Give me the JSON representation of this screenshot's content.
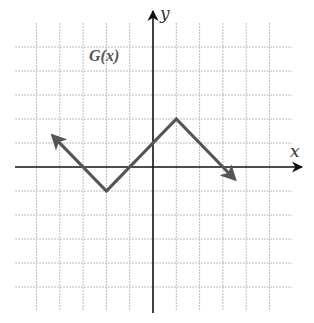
{
  "chart_data": {
    "type": "line",
    "title": "",
    "function_label": "G(x)",
    "xlabel": "x",
    "ylabel": "y",
    "xlim": [
      -6,
      6
    ],
    "ylim": [
      -6,
      6
    ],
    "grid": true,
    "grid_step": 1,
    "ticks_labeled": false,
    "series": [
      {
        "name": "G(x)",
        "style": "piecewise-linear with arrows at both ends",
        "points": [
          {
            "x": -4.3,
            "y": 1.3
          },
          {
            "x": -2,
            "y": -1
          },
          {
            "x": 1,
            "y": 2
          },
          {
            "x": 3.5,
            "y": -0.5
          }
        ],
        "vertices": [
          {
            "x": -2,
            "y": -1,
            "kind": "minimum"
          },
          {
            "x": 1,
            "y": 2,
            "kind": "maximum"
          }
        ],
        "x_intercepts": [
          -3,
          0,
          3
        ],
        "y_intercept": 1,
        "color": "#555555"
      }
    ],
    "axis_color": "#111111",
    "grid_color": "#bbbbbb"
  }
}
